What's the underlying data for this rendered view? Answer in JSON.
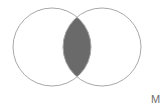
{
  "diagram": {
    "type": "venn-two-set",
    "title": "",
    "background_color": "#ffffff",
    "outline_color": "#a8a8a8",
    "outline_width": 1,
    "set_fill_color": "#ffffff",
    "intersection_fill_color": "#6a6a6a",
    "sets": [
      {
        "id": "left-set",
        "label": "",
        "center_x": 52,
        "center_y": 47,
        "radius": 39,
        "filled": false
      },
      {
        "id": "right-set",
        "label": "",
        "center_x": 102,
        "center_y": 47,
        "radius": 39,
        "filled": false
      }
    ],
    "intersection": {
      "id": "intersection-region",
      "label": "",
      "shaded": true,
      "shade_color": "#6a6a6a",
      "top_tip_y": 14,
      "bottom_tip_y": 80,
      "widest_x_start": 58,
      "widest_x_end": 96
    }
  },
  "annotations": {
    "corner_mark": "M",
    "corner_mark_color": "#6e6e6e"
  }
}
